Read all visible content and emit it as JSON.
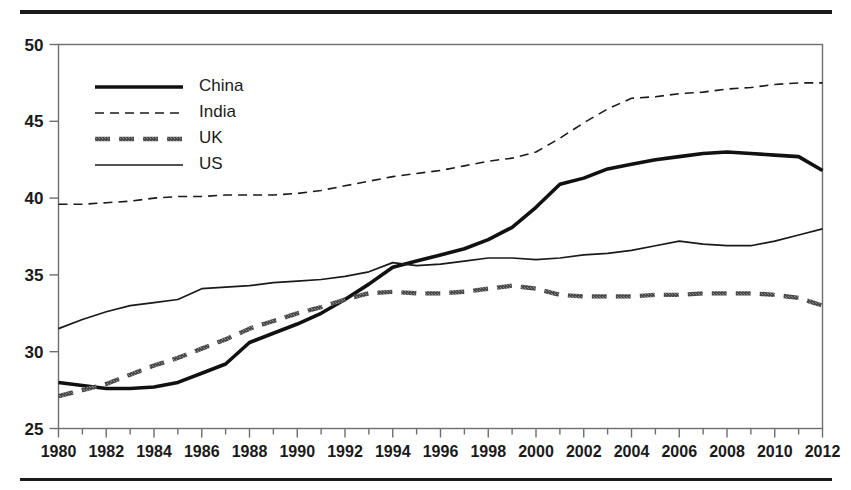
{
  "chart_data": {
    "type": "line",
    "title": "",
    "subtitle": "",
    "xlabel": "",
    "ylabel": "",
    "xlim": [
      1980,
      2012
    ],
    "ylim": [
      25,
      50
    ],
    "x_ticks": [
      1980,
      1982,
      1984,
      1986,
      1988,
      1990,
      1992,
      1994,
      1996,
      1998,
      2000,
      2002,
      2004,
      2006,
      2008,
      2010,
      2012
    ],
    "x_minor_ticks": [
      1981,
      1983,
      1985,
      1987,
      1989,
      1991,
      1993,
      1995,
      1997,
      1999,
      2001,
      2003,
      2005,
      2007,
      2009,
      2011
    ],
    "y_ticks": [
      25,
      30,
      35,
      40,
      45,
      50
    ],
    "grid": false,
    "legend_position": "top-left",
    "x": [
      1980,
      1981,
      1982,
      1983,
      1984,
      1985,
      1986,
      1987,
      1988,
      1989,
      1990,
      1991,
      1992,
      1993,
      1994,
      1995,
      1996,
      1997,
      1998,
      1999,
      2000,
      2001,
      2002,
      2003,
      2004,
      2005,
      2006,
      2007,
      2008,
      2009,
      2010,
      2011,
      2012
    ],
    "series": [
      {
        "name": "China",
        "style": "thick-solid",
        "color": "#111111",
        "width": 3.6,
        "values": [
          28.0,
          27.8,
          27.6,
          27.6,
          27.7,
          28.0,
          28.6,
          29.2,
          30.6,
          31.2,
          31.8,
          32.5,
          33.4,
          34.4,
          35.5,
          35.9,
          36.3,
          36.7,
          37.3,
          38.1,
          39.4,
          40.9,
          41.3,
          41.9,
          42.2,
          42.5,
          42.7,
          42.9,
          43.0,
          42.9,
          42.8,
          42.7,
          41.8
        ]
      },
      {
        "name": "India",
        "style": "thin-dashed",
        "color": "#1a1a1a",
        "width": 1.6,
        "values": [
          39.6,
          39.6,
          39.7,
          39.8,
          40.0,
          40.1,
          40.1,
          40.2,
          40.2,
          40.2,
          40.3,
          40.5,
          40.8,
          41.1,
          41.4,
          41.6,
          41.8,
          42.1,
          42.4,
          42.6,
          43.0,
          43.9,
          44.9,
          45.8,
          46.5,
          46.6,
          46.8,
          46.9,
          47.1,
          47.2,
          47.4,
          47.5,
          47.5
        ]
      },
      {
        "name": "UK",
        "style": "thick-dashed",
        "color": "#4a4a4a",
        "width": 4.4,
        "values": [
          27.1,
          27.5,
          27.9,
          28.5,
          29.1,
          29.6,
          30.2,
          30.8,
          31.5,
          32.0,
          32.5,
          32.9,
          33.4,
          33.8,
          33.9,
          33.8,
          33.8,
          33.9,
          34.1,
          34.3,
          34.1,
          33.7,
          33.6,
          33.6,
          33.6,
          33.7,
          33.7,
          33.8,
          33.8,
          33.8,
          33.7,
          33.5,
          33.0
        ]
      },
      {
        "name": "US",
        "style": "thin-solid",
        "color": "#1a1a1a",
        "width": 1.7,
        "values": [
          31.5,
          32.1,
          32.6,
          33.0,
          33.2,
          33.4,
          34.1,
          34.2,
          34.3,
          34.5,
          34.6,
          34.7,
          34.9,
          35.2,
          35.8,
          35.6,
          35.7,
          35.9,
          36.1,
          36.1,
          36.0,
          36.1,
          36.3,
          36.4,
          36.6,
          36.9,
          37.2,
          37.0,
          36.9,
          36.9,
          37.2,
          37.6,
          38.0
        ]
      }
    ]
  },
  "legend": {
    "items": [
      {
        "label": "China"
      },
      {
        "label": "India"
      },
      {
        "label": "UK"
      },
      {
        "label": "US"
      }
    ]
  }
}
